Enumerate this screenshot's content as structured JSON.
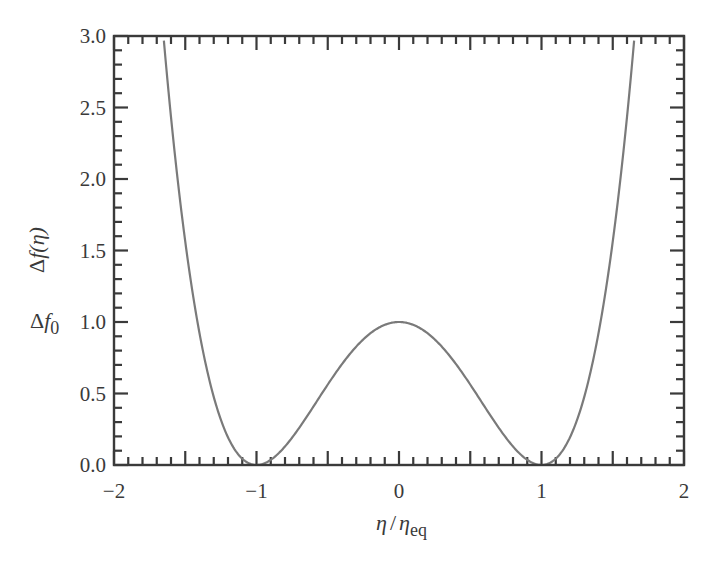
{
  "chart_data": {
    "type": "line",
    "title": "",
    "xlabel": "η / η_eq",
    "ylabel": "Δf(η)",
    "xlim": [
      -2,
      2
    ],
    "ylim": [
      0,
      3.0
    ],
    "x_ticks": [
      "−2",
      "−1",
      "0",
      "1",
      "2"
    ],
    "x_tick_values": [
      -2,
      -1,
      0,
      1,
      2
    ],
    "y_ticks": [
      "0.0",
      "0.5",
      "1.0",
      "1.5",
      "2.0",
      "2.5",
      "3.0"
    ],
    "y_tick_values": [
      0,
      0.5,
      1.0,
      1.5,
      2.0,
      2.5,
      3.0
    ],
    "x_minor_step": 0.1,
    "y_minor_step": 0.1,
    "grid": false,
    "legend": null,
    "annotations": [
      {
        "text": "Δf0",
        "at_y": 1.0,
        "position": "left of y-axis"
      }
    ],
    "series": [
      {
        "name": "Δf(η) = Δf0 (η²/η_eq² − 1)²",
        "color": "#7a7a7a",
        "x": [
          -1.65,
          -1.6,
          -1.5,
          -1.4,
          -1.3,
          -1.2,
          -1.1,
          -1.0,
          -0.9,
          -0.8,
          -0.7,
          -0.6,
          -0.5,
          -0.4,
          -0.3,
          -0.2,
          -0.1,
          0.0,
          0.1,
          0.2,
          0.3,
          0.4,
          0.5,
          0.6,
          0.7,
          0.8,
          0.9,
          1.0,
          1.1,
          1.2,
          1.3,
          1.4,
          1.5,
          1.6,
          1.65
        ],
        "y": [
          3.0,
          2.43,
          1.56,
          0.92,
          0.48,
          0.19,
          0.04,
          0.0,
          0.04,
          0.13,
          0.26,
          0.41,
          0.56,
          0.71,
          0.83,
          0.92,
          0.98,
          1.0,
          0.98,
          0.92,
          0.83,
          0.71,
          0.56,
          0.41,
          0.26,
          0.13,
          0.04,
          0.0,
          0.04,
          0.19,
          0.48,
          0.92,
          1.56,
          2.43,
          3.0
        ]
      }
    ]
  },
  "labels": {
    "ylabel_prefix": "Δ",
    "ylabel_f": "f",
    "ylabel_arg": "(η)",
    "xlabel_eta": "η",
    "xlabel_slash": "/",
    "xlabel_eta2": "η",
    "xlabel_sub": "eq",
    "annotation_delta": "Δ",
    "annotation_f": "f",
    "annotation_sub": "0"
  },
  "style": {
    "axis_color": "#3a3a3a",
    "curve_color": "#7a7a7a"
  }
}
